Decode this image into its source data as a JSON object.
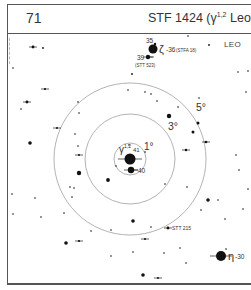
{
  "header": {
    "page_number": "71",
    "title_prefix": "STF 1424 (γ",
    "title_sup": "1,2",
    "title_suffix": " Leo)"
  },
  "chart": {
    "constellation": "LEO",
    "center": {
      "x": 130,
      "y": 159
    },
    "rings": [
      {
        "label": "1°",
        "radius": 16,
        "label_x": 144,
        "label_y": 150
      },
      {
        "label": "3°",
        "radius": 45,
        "label_x": 168,
        "label_y": 130
      },
      {
        "label": "5°",
        "radius": 76,
        "label_x": 196,
        "label_y": 111
      }
    ],
    "labels": {
      "gamma": "γ",
      "gamma_sup": "1,2",
      "gamma_num": "41",
      "star_40": "40",
      "star_35": "35",
      "zeta": "ζ",
      "zeta_num": "36",
      "stfa18": "(STFA 18)",
      "star_39": "39",
      "stt523": "(STT 523)",
      "stt215": "STT 215",
      "eta": "η",
      "eta_num": "30"
    },
    "stars": [
      {
        "x": 130,
        "y": 159,
        "r": 5.5,
        "name": "gamma-leo",
        "tick": true
      },
      {
        "x": 131,
        "y": 170,
        "r": 3.2,
        "name": "40-leo",
        "tick": true
      },
      {
        "x": 153,
        "y": 49,
        "r": 4.5,
        "name": "zeta-leo"
      },
      {
        "x": 155,
        "y": 44,
        "r": 1.2,
        "name": "35-leo"
      },
      {
        "x": 148,
        "y": 57,
        "r": 2.2,
        "name": "39-leo",
        "tick": true
      },
      {
        "x": 221,
        "y": 256,
        "r": 5,
        "name": "eta-leo",
        "tick": true
      },
      {
        "x": 168,
        "y": 228,
        "r": 1.4,
        "name": "stt-215",
        "tick": true
      },
      {
        "x": 33,
        "y": 47,
        "r": 1.4,
        "tick": true
      },
      {
        "x": 43,
        "y": 48,
        "r": 0.9
      },
      {
        "x": 188,
        "y": 36,
        "r": 0.8
      },
      {
        "x": 209,
        "y": 45,
        "r": 0.9
      },
      {
        "x": 45,
        "y": 89,
        "r": 1.1,
        "tick": true
      },
      {
        "x": 132,
        "y": 74,
        "r": 0.9
      },
      {
        "x": 128,
        "y": 90,
        "r": 0.8
      },
      {
        "x": 145,
        "y": 92,
        "r": 0.8
      },
      {
        "x": 151,
        "y": 94,
        "r": 0.8
      },
      {
        "x": 27,
        "y": 102,
        "r": 1.4,
        "tick": true
      },
      {
        "x": 21,
        "y": 109,
        "r": 0.8
      },
      {
        "x": 78,
        "y": 102,
        "r": 0.8
      },
      {
        "x": 57,
        "y": 128,
        "r": 1.0,
        "tick": true
      },
      {
        "x": 30,
        "y": 143,
        "r": 1.8
      },
      {
        "x": 35,
        "y": 198,
        "r": 0.8
      },
      {
        "x": 12,
        "y": 194,
        "r": 0.8
      },
      {
        "x": 41,
        "y": 217,
        "r": 0.8
      },
      {
        "x": 13,
        "y": 214,
        "r": 0.8
      },
      {
        "x": 79,
        "y": 113,
        "r": 0.8
      },
      {
        "x": 75,
        "y": 134,
        "r": 0.8
      },
      {
        "x": 78,
        "y": 146,
        "r": 0.8
      },
      {
        "x": 79,
        "y": 155,
        "r": 1.0,
        "tick": true
      },
      {
        "x": 79,
        "y": 173,
        "r": 2.2
      },
      {
        "x": 74,
        "y": 188,
        "r": 0.8
      },
      {
        "x": 72,
        "y": 197,
        "r": 0.8
      },
      {
        "x": 64,
        "y": 213,
        "r": 0.8
      },
      {
        "x": 70,
        "y": 187,
        "r": 0.8
      },
      {
        "x": 91,
        "y": 231,
        "r": 0.8
      },
      {
        "x": 108,
        "y": 180,
        "r": 1.9
      },
      {
        "x": 165,
        "y": 184,
        "r": 0.8
      },
      {
        "x": 157,
        "y": 101,
        "r": 0.8
      },
      {
        "x": 129,
        "y": 145,
        "r": 0.8
      },
      {
        "x": 116,
        "y": 166,
        "r": 0.8
      },
      {
        "x": 145,
        "y": 152,
        "r": 0.8
      },
      {
        "x": 169,
        "y": 116,
        "r": 2.2
      },
      {
        "x": 178,
        "y": 107,
        "r": 0.8
      },
      {
        "x": 199,
        "y": 98,
        "r": 0.8
      },
      {
        "x": 198,
        "y": 123,
        "r": 1.5
      },
      {
        "x": 193,
        "y": 132,
        "r": 1.5
      },
      {
        "x": 206,
        "y": 142,
        "r": 1.3,
        "tick": true
      },
      {
        "x": 186,
        "y": 150,
        "r": 1.2,
        "tick": true
      },
      {
        "x": 187,
        "y": 187,
        "r": 0.8
      },
      {
        "x": 208,
        "y": 200,
        "r": 1.8
      },
      {
        "x": 218,
        "y": 200,
        "r": 0.8
      },
      {
        "x": 201,
        "y": 210,
        "r": 0.8
      },
      {
        "x": 236,
        "y": 155,
        "r": 0.8
      },
      {
        "x": 239,
        "y": 170,
        "r": 0.8
      },
      {
        "x": 246,
        "y": 92,
        "r": 0.8
      },
      {
        "x": 248,
        "y": 71,
        "r": 0.8
      },
      {
        "x": 238,
        "y": 72,
        "r": 0.8
      },
      {
        "x": 225,
        "y": 219,
        "r": 0.8
      },
      {
        "x": 248,
        "y": 189,
        "r": 0.8
      },
      {
        "x": 226,
        "y": 249,
        "r": 0.8
      },
      {
        "x": 243,
        "y": 209,
        "r": 0.8
      },
      {
        "x": 133,
        "y": 221,
        "r": 1.8
      },
      {
        "x": 111,
        "y": 230,
        "r": 0.8
      },
      {
        "x": 145,
        "y": 239,
        "r": 1.0,
        "tick": true
      },
      {
        "x": 151,
        "y": 227,
        "r": 0.8
      },
      {
        "x": 180,
        "y": 248,
        "r": 0.8
      },
      {
        "x": 164,
        "y": 253,
        "r": 0.8
      },
      {
        "x": 186,
        "y": 263,
        "r": 0.8
      },
      {
        "x": 111,
        "y": 256,
        "r": 0.8
      },
      {
        "x": 133,
        "y": 252,
        "r": 0.8
      },
      {
        "x": 143,
        "y": 275,
        "r": 1.8
      },
      {
        "x": 158,
        "y": 278,
        "r": 1.0,
        "tick": true
      },
      {
        "x": 66,
        "y": 243,
        "r": 1.8
      },
      {
        "x": 79,
        "y": 241,
        "r": 1.1,
        "tick": true
      },
      {
        "x": 13,
        "y": 68,
        "r": 0.8
      }
    ],
    "colors": {
      "ring": "#aaaaaa",
      "star": "#111111",
      "frame": "#555555",
      "text": "#333333"
    }
  }
}
